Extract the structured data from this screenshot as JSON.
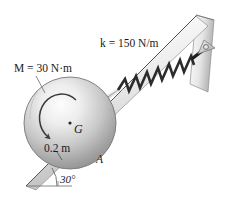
{
  "figure": {
    "name": "disk-on-incline-with-spring",
    "background_color": "#ffffff",
    "labels": {
      "spring_constant": "k = 150 N/m",
      "moment": "M = 30 N·m",
      "center": "G",
      "radius": "0.2 m",
      "contact_point": "A",
      "incline_angle": "30°"
    },
    "parts": {
      "disk": "disk",
      "spring": "spring",
      "rod": "rod",
      "incline": "incline-surface",
      "wall": "vertical-wall",
      "bracket": "pin-bracket",
      "ground_line": "horizontal-reference-line",
      "moment_arrow": "moment-arrow",
      "radius_tick": "radius-tick",
      "angle_arc": "angle-arc",
      "leader": "moment-leader-line",
      "pin": "pin-joint"
    },
    "colors": {
      "ink": "#1a1a1a",
      "disk_light": "#f2f2f2",
      "disk_mid": "#bdbdbd",
      "disk_dark": "#8a8a8a",
      "plane_light": "#fbfbfb",
      "plane_mid": "#d8d8d8",
      "plane_dark": "#a8a8a8",
      "spring": "#2b2b2b",
      "rod": "#cfcfcf",
      "bracket": "#c9c9c9"
    }
  }
}
